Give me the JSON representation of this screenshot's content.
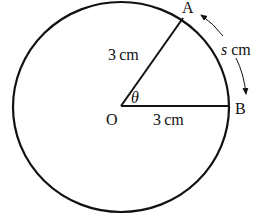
{
  "diagram": {
    "type": "circle-sector",
    "colors": {
      "stroke": "#111111",
      "background": "#ffffff"
    },
    "points": {
      "center": {
        "label": "O"
      },
      "a": {
        "label": "A"
      },
      "b": {
        "label": "B"
      }
    },
    "labels": {
      "radius_oa": "3 cm",
      "radius_ob": "3 cm",
      "angle": "θ",
      "arc_var": "s",
      "arc_unit": " cm"
    }
  }
}
